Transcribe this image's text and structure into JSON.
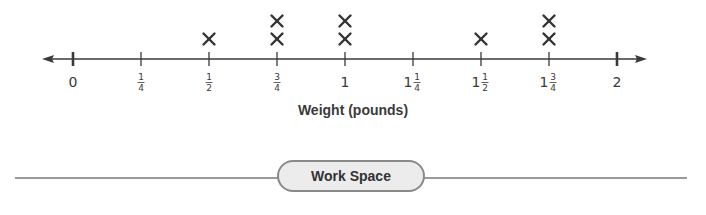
{
  "chart_data": {
    "type": "line-plot",
    "title": "",
    "xlabel": "Weight (pounds)",
    "ylabel": "",
    "xlim": [
      0,
      2
    ],
    "ticks": [
      {
        "value": 0,
        "label": "0"
      },
      {
        "value": 0.25,
        "label": "1/4"
      },
      {
        "value": 0.5,
        "label": "1/2"
      },
      {
        "value": 0.75,
        "label": "3/4"
      },
      {
        "value": 1,
        "label": "1"
      },
      {
        "value": 1.25,
        "label": "1 1/4"
      },
      {
        "value": 1.5,
        "label": "1 1/2"
      },
      {
        "value": 1.75,
        "label": "1 3/4"
      },
      {
        "value": 2,
        "label": "2"
      }
    ],
    "marker": "X",
    "categories": [
      "0",
      "1/4",
      "1/2",
      "3/4",
      "1",
      "1 1/4",
      "1 1/2",
      "1 3/4",
      "2"
    ],
    "values": [
      0,
      0,
      1,
      2,
      2,
      0,
      1,
      2,
      0
    ],
    "grid": false,
    "legend": null
  },
  "axis": {
    "xlabel": "Weight (pounds)"
  },
  "workspace": {
    "label": "Work Space"
  },
  "colors": {
    "axis": "#3a3a3a",
    "marker": "#333333",
    "pill_fill": "#ececec",
    "pill_border": "#8a8a8a",
    "rule": "#9a9a9a"
  }
}
